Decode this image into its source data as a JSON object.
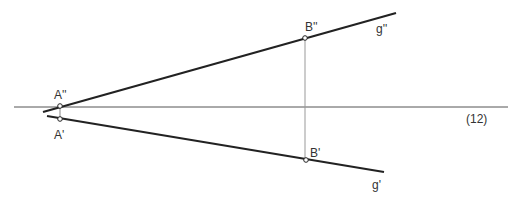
{
  "diagram": {
    "axis_label": "(12)",
    "points": {
      "A_upper": {
        "label": "A''",
        "x": 60,
        "y": 106
      },
      "A_lower": {
        "label": "A'",
        "x": 60,
        "y": 119
      },
      "B_upper": {
        "label": "B''",
        "x": 305,
        "y": 38
      },
      "B_lower": {
        "label": "B'",
        "x": 306,
        "y": 160
      }
    },
    "lines": {
      "g_upper": {
        "label": "g''"
      },
      "g_lower": {
        "label": "g'"
      }
    },
    "colors": {
      "line": "#222222",
      "axis": "#555555",
      "projector": "#888888"
    }
  }
}
